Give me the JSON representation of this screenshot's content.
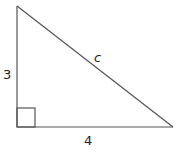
{
  "figure": {
    "type": "right-triangle",
    "stroke_color": "#555555",
    "label_color": "#222222",
    "vertices": {
      "top": [
        17,
        6
      ],
      "right_angle": [
        17,
        127
      ],
      "right": [
        173,
        127
      ]
    },
    "right_angle_marker": {
      "x": 17,
      "y": 108,
      "size": 19
    },
    "labels": {
      "vertical_leg": "3",
      "horizontal_leg": "4",
      "hypotenuse": "c"
    }
  }
}
